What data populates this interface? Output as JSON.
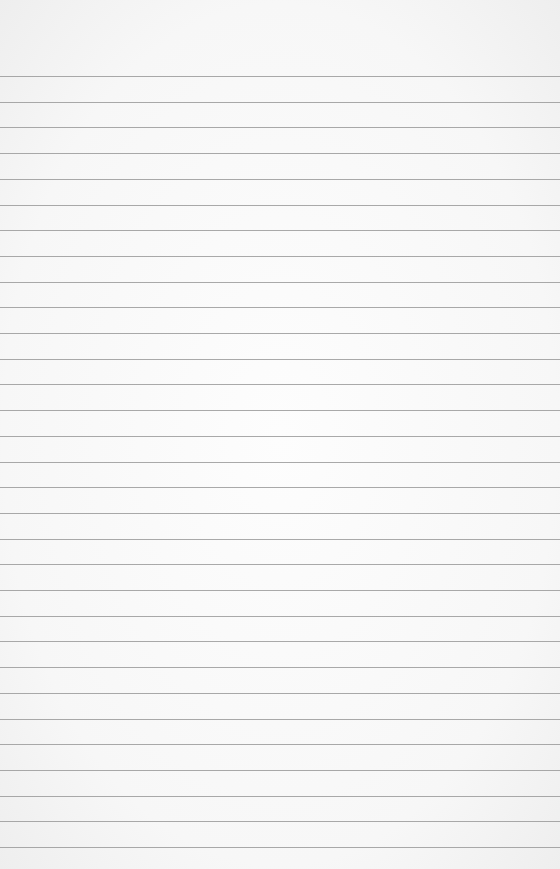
{
  "paper": {
    "type": "lined-paper",
    "line_count": 31,
    "first_line_y": 76,
    "line_spacing": 25.7,
    "line_color": "#9a9a9a",
    "background_color": "#f7f7f7"
  }
}
